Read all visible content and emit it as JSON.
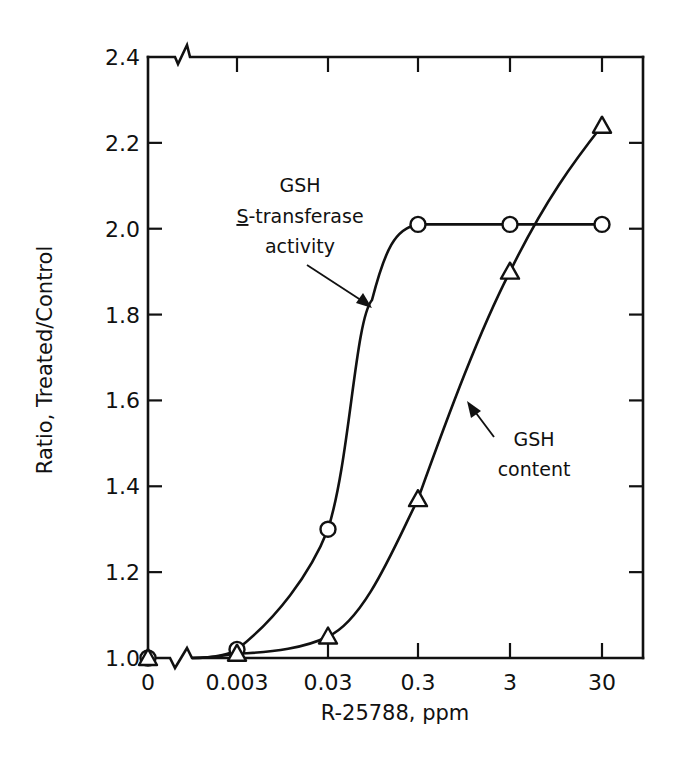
{
  "chart_data": {
    "type": "line",
    "title": "",
    "xlabel": "R-25788, ppm",
    "ylabel": "Ratio, Treated/Control",
    "x_scale": "log (with broken axis at 0)",
    "categories": [
      "0",
      "0.003",
      "0.03",
      "0.3",
      "3",
      "30"
    ],
    "x": [
      0,
      0.003,
      0.03,
      0.3,
      3,
      30
    ],
    "ylim": [
      1.0,
      2.4
    ],
    "yticks": [
      "1.0",
      "1.2",
      "1.4",
      "1.6",
      "1.8",
      "2.0",
      "2.2",
      "2.4"
    ],
    "grid": false,
    "legend": "none (inline annotations)",
    "series": [
      {
        "name": "GSH S-transferase activity",
        "marker": "circle",
        "values": [
          1.0,
          1.02,
          1.3,
          2.01,
          2.01,
          2.01
        ]
      },
      {
        "name": "GSH content",
        "marker": "triangle",
        "values": [
          1.0,
          1.01,
          1.05,
          1.37,
          1.9,
          2.24
        ]
      }
    ],
    "annotations": [
      {
        "lines": [
          "GSH",
          "S-transferase",
          "activity"
        ],
        "underline_first_char_of_line": 1,
        "points_to": "GSH S-transferase activity"
      },
      {
        "lines": [
          "GSH",
          "content"
        ],
        "points_to": "GSH content"
      }
    ]
  },
  "labels": {
    "xlabel": "R-25788, ppm",
    "ylabel": "Ratio, Treated/Control",
    "x_ticks": [
      "0",
      "0.003",
      "0.03",
      "0.3",
      "3",
      "30"
    ],
    "y_ticks": [
      "1.0",
      "1.2",
      "1.4",
      "1.6",
      "1.8",
      "2.0",
      "2.2",
      "2.4"
    ],
    "y_first_tick": "1.0",
    "annot_activity": [
      "GSH",
      "S",
      "-transferase",
      "activity"
    ],
    "annot_content": [
      "GSH",
      "content"
    ]
  }
}
